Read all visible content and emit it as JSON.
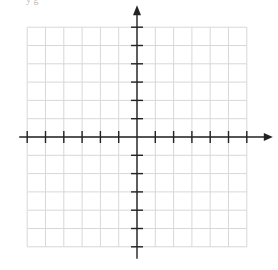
{
  "diagram": {
    "type": "coordinate-plane",
    "top_text_fragment": "y  g",
    "origin_px": [
      137,
      137
    ],
    "grid_spacing_px": 18.3,
    "x_range": [
      -6,
      6
    ],
    "y_range": [
      -6,
      6
    ],
    "grid_color": "#d8d8d8",
    "axis_color": "#222222",
    "x_axis_arrow": "right",
    "y_axis_arrow": "up",
    "tick_labels": []
  }
}
